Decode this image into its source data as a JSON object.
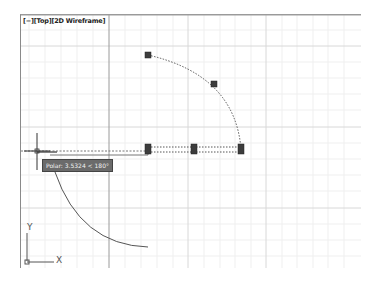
{
  "viewport": {
    "label": "[−][Top][2D Wireframe]",
    "view": "Top",
    "visual_style": "2D Wireframe"
  },
  "tooltip": {
    "text": "Polar: 3.5324 < 180°"
  },
  "ucs_icon": {
    "x_label": "X",
    "y_label": "Y"
  },
  "grips": [
    {
      "name": "arc-start-grip",
      "x": 148,
      "y": 55
    },
    {
      "name": "arc-mid-grip",
      "x": 214,
      "y": 84
    },
    {
      "name": "line-start-grip",
      "x": 148,
      "y": 149
    },
    {
      "name": "line-mid-grip",
      "x": 194,
      "y": 149
    },
    {
      "name": "line-end-grip",
      "x": 241,
      "y": 149
    }
  ],
  "colors": {
    "grid_minor": "#eeeeee",
    "grid_major": "#d6d6d6",
    "grip": "#3c3c3c",
    "geometry": "#555555"
  }
}
